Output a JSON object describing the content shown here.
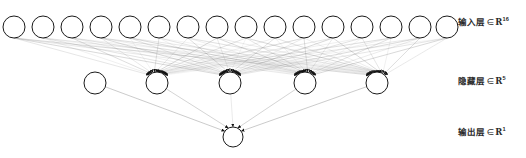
{
  "diagram": {
    "type": "neural-network-architecture",
    "title": "",
    "background_color": "#ffffff",
    "node_stroke_color": "#1a1a1a",
    "node_fill_color": "#ffffff",
    "edge_color": "#808080",
    "arrow_color": "#111111"
  },
  "labels": {
    "input": {
      "text": "输入层",
      "member": "∈",
      "set": "R",
      "dim": "16",
      "full": "输入层∈R16"
    },
    "hidden": {
      "text": "隐藏层",
      "member": "∈",
      "set": "R",
      "dim": "5",
      "full": "隐藏层∈R5"
    },
    "output": {
      "text": "输出层",
      "member": "∈",
      "set": "R",
      "dim": "1",
      "full": "输出层∈R1"
    }
  },
  "layers": [
    {
      "name": "input-layer",
      "label": "输入层",
      "dimension": 16,
      "node_count": 16,
      "y": 27,
      "radius": 11,
      "x_positions": [
        14,
        43,
        72,
        101,
        130,
        159,
        188,
        217,
        246,
        275,
        304,
        333,
        362,
        391,
        420,
        447
      ]
    },
    {
      "name": "hidden-layer",
      "label": "隐藏层",
      "dimension": 5,
      "node_count": 5,
      "y": 83,
      "radius": 11,
      "x_positions": [
        95,
        157,
        230,
        305,
        377
      ],
      "nodes_with_incoming": [
        1,
        2,
        3,
        4
      ],
      "isolated_node_index": 0
    },
    {
      "name": "output-layer",
      "label": "输出层",
      "dimension": 1,
      "node_count": 1,
      "y": 137,
      "radius": 10,
      "x_positions": [
        233
      ]
    }
  ],
  "connections": {
    "input_to_hidden": {
      "from_layer": "input-layer",
      "to_layer": "hidden-layer",
      "to_node_indices": [
        1,
        2,
        3,
        4
      ],
      "edge_count": 64,
      "style": "thin-gray-variable-opacity"
    },
    "hidden_to_output": {
      "from_layer": "hidden-layer",
      "to_layer": "output-layer",
      "edge_count": 5,
      "style": "thin-gray"
    }
  }
}
